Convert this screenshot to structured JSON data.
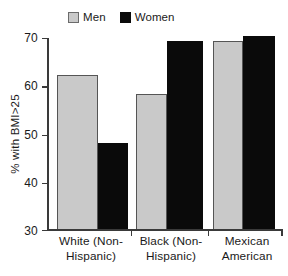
{
  "chart_data": {
    "type": "bar",
    "title": "",
    "subtitle": "",
    "xlabel": "",
    "ylabel": "% with BMI>25",
    "ylim": [
      30,
      70
    ],
    "ytick_values": [
      70,
      60,
      50,
      40,
      30
    ],
    "ytick_labels": [
      "70",
      "60",
      "50",
      "40",
      "30"
    ],
    "grid": false,
    "legend_position": "top-center",
    "categories": [
      "White (Non-Hispanic)",
      "Black (Non-Hispanic)",
      "Mexican American"
    ],
    "category_lines": [
      [
        "White (Non-",
        "Hispanic)"
      ],
      [
        "Black (Non-",
        "Hispanic)"
      ],
      [
        "Mexican",
        "American"
      ]
    ],
    "series": [
      {
        "name": "Men",
        "color": "#c9c9c9",
        "values": [
          62,
          58,
          69
        ]
      },
      {
        "name": "Women",
        "color": "#0a0a0a",
        "values": [
          48,
          69,
          70
        ]
      }
    ],
    "annotations": []
  },
  "legend": {
    "entries": [
      {
        "label": "Men",
        "swatch": "gray-swatch-icon"
      },
      {
        "label": "Women",
        "swatch": "black-swatch-icon"
      }
    ]
  },
  "axes": {
    "y_title": "% with BMI>25",
    "y_ticks": [
      "70",
      "60",
      "50",
      "40",
      "30"
    ],
    "x_categories": [
      {
        "line1": "White (Non-",
        "line2": "Hispanic)"
      },
      {
        "line1": "Black (Non-",
        "line2": "Hispanic)"
      },
      {
        "line1": "Mexican",
        "line2": "American"
      }
    ]
  },
  "colors": {
    "men_fill": "#c9c9c9",
    "men_border": "#555555",
    "women_fill": "#0a0a0a",
    "axis": "#3a3a3a",
    "text": "#1a1a1a",
    "background": "#ffffff"
  }
}
